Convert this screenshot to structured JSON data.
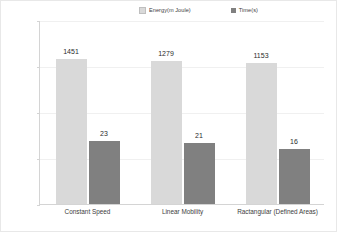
{
  "chart_data": {
    "type": "bar",
    "title": "",
    "xlabel": "",
    "ylabel": "",
    "scale": "log",
    "ylim": [
      1,
      10000
    ],
    "grid": true,
    "legend_position": "top-center",
    "categories": [
      "Constant Speed",
      "Linear Mobility",
      "Ractangular (Defined Areas)"
    ],
    "ytick_labels": [
      "10000",
      "1000",
      "100",
      "10",
      "1"
    ],
    "ytick_values": [
      10000,
      1000,
      100,
      10,
      1
    ],
    "series": [
      {
        "name": "Energy(m Joule)",
        "color": "#d9d9d9",
        "values": [
          1451,
          1279,
          1153
        ],
        "labels": [
          "1451",
          "1279",
          "1153"
        ]
      },
      {
        "name": "Time(s)",
        "color": "#808080",
        "values": [
          23,
          21,
          16
        ],
        "labels": [
          "23",
          "21",
          "16"
        ]
      }
    ]
  },
  "legend": {
    "entries": [
      {
        "label": "Energy(m Joule)"
      },
      {
        "label": "Time(s)"
      }
    ]
  },
  "colors": {
    "energy": "#d9d9d9",
    "time": "#808080",
    "axis": "#d4d4d4",
    "grid": "#f0f0f0",
    "text": "#3d3d3d"
  }
}
